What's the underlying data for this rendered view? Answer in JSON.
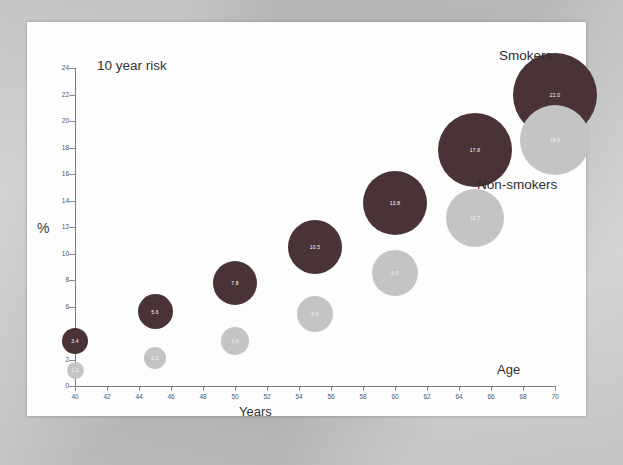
{
  "chart_data": {
    "type": "scatter",
    "title": "10 year risk",
    "xlabel": "Years",
    "ylabel": "%",
    "xlim": [
      40,
      70
    ],
    "ylim": [
      0,
      24
    ],
    "x_tick_labels": [
      "40",
      "42",
      "44",
      "46",
      "48",
      "50",
      "52",
      "54",
      "56",
      "58",
      "60",
      "62",
      "64",
      "66",
      "68",
      "70"
    ],
    "y_tick_labels": [
      "0",
      "2",
      "4",
      "6",
      "8",
      "10",
      "12",
      "14",
      "16",
      "18",
      "20",
      "22",
      "24"
    ],
    "grid": false,
    "axis_right_label": "Age",
    "legend_position": "in-plot-right",
    "series": [
      {
        "name": "Smokers",
        "color": "#4a3336",
        "points": [
          {
            "x": 40,
            "y": 3.4,
            "label": "3.4",
            "size": 26
          },
          {
            "x": 45,
            "y": 5.6,
            "label": "5.6",
            "size": 35
          },
          {
            "x": 50,
            "y": 7.8,
            "label": "7.8",
            "size": 44
          },
          {
            "x": 55,
            "y": 10.5,
            "label": "10.5",
            "size": 54
          },
          {
            "x": 60,
            "y": 13.8,
            "label": "13.8",
            "size": 64
          },
          {
            "x": 65,
            "y": 17.8,
            "label": "17.8",
            "size": 74
          },
          {
            "x": 70,
            "y": 22.0,
            "label": "22.0",
            "size": 84
          }
        ]
      },
      {
        "name": "Non-smokers",
        "color": "#c4c4c4",
        "points": [
          {
            "x": 40,
            "y": 1.2,
            "label": "1.2",
            "size": 17
          },
          {
            "x": 45,
            "y": 2.1,
            "label": "2.1",
            "size": 22
          },
          {
            "x": 50,
            "y": 3.4,
            "label": "3.4",
            "size": 28
          },
          {
            "x": 55,
            "y": 5.4,
            "label": "5.4",
            "size": 36
          },
          {
            "x": 60,
            "y": 8.5,
            "label": "8.5",
            "size": 46
          },
          {
            "x": 65,
            "y": 12.7,
            "label": "12.7",
            "size": 58
          },
          {
            "x": 70,
            "y": 18.6,
            "label": "18.6",
            "size": 70
          }
        ]
      }
    ]
  },
  "labels": {
    "title": "10 year risk",
    "y_axis_title": "%",
    "x_axis_title": "Years",
    "age": "Age",
    "smokers": "Smokers",
    "non_smokers": "Non-smokers"
  }
}
